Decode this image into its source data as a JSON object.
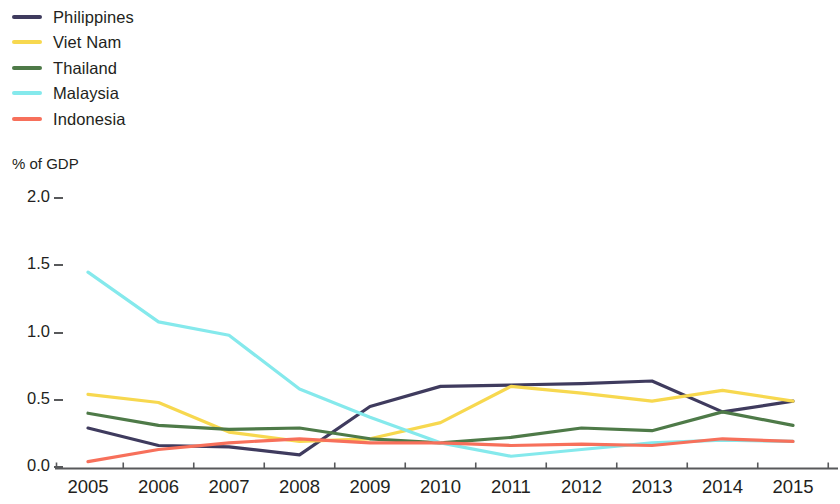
{
  "legend": {
    "position": "top-left",
    "items": [
      {
        "label": "Philippines",
        "color": "#3f3b5e",
        "swatch": "line-swatch"
      },
      {
        "label": "Viet Nam",
        "color": "#f7d84f",
        "swatch": "line-swatch"
      },
      {
        "label": "Thailand",
        "color": "#4e7a48",
        "swatch": "line-swatch"
      },
      {
        "label": "Malaysia",
        "color": "#85e9ec",
        "swatch": "line-swatch"
      },
      {
        "label": "Indonesia",
        "color": "#f7705b",
        "swatch": "line-swatch"
      }
    ]
  },
  "axis": {
    "y_unit_label": "% of GDP",
    "y_ticks": [
      "0.0",
      "0.5",
      "1.0",
      "1.5",
      "2.0"
    ],
    "x_ticks": [
      "2005",
      "2006",
      "2007",
      "2008",
      "2009",
      "2010",
      "2011",
      "2012",
      "2013",
      "2014",
      "2015"
    ]
  },
  "chart_data": {
    "type": "line",
    "title": "",
    "subtitle": "",
    "xlabel": "",
    "ylabel": "% of GDP",
    "ylim": [
      0.0,
      2.0
    ],
    "yticks": [
      0.0,
      0.5,
      1.0,
      1.5,
      2.0
    ],
    "grid": false,
    "legend_position": "top-left",
    "categories": [
      "2005",
      "2006",
      "2007",
      "2008",
      "2009",
      "2010",
      "2011",
      "2012",
      "2013",
      "2014",
      "2015"
    ],
    "x": [
      2005,
      2006,
      2007,
      2008,
      2009,
      2010,
      2011,
      2012,
      2013,
      2014,
      2015
    ],
    "series": [
      {
        "name": "Philippines",
        "color": "#3f3b5e",
        "values": [
          0.29,
          0.16,
          0.15,
          0.09,
          0.45,
          0.6,
          0.61,
          0.62,
          0.64,
          0.41,
          0.49
        ]
      },
      {
        "name": "Viet Nam",
        "color": "#f7d84f",
        "values": [
          0.54,
          0.48,
          0.26,
          0.19,
          0.21,
          0.33,
          0.6,
          0.55,
          0.49,
          0.57,
          0.49
        ]
      },
      {
        "name": "Thailand",
        "color": "#4e7a48",
        "values": [
          0.4,
          0.31,
          0.28,
          0.29,
          0.21,
          0.18,
          0.22,
          0.29,
          0.27,
          0.41,
          0.31
        ]
      },
      {
        "name": "Malaysia",
        "color": "#85e9ec",
        "values": [
          1.45,
          1.08,
          0.98,
          0.58,
          0.37,
          0.18,
          0.08,
          0.13,
          0.18,
          0.2,
          0.19
        ]
      },
      {
        "name": "Indonesia",
        "color": "#f7705b",
        "values": [
          0.04,
          0.13,
          0.18,
          0.21,
          0.18,
          0.18,
          0.16,
          0.17,
          0.16,
          0.21,
          0.19
        ]
      }
    ]
  }
}
